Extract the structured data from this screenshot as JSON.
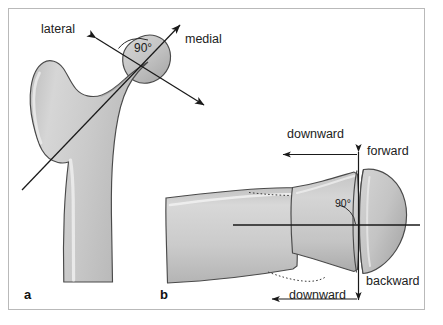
{
  "figure": {
    "background_color": "#ffffff",
    "border_color": "#b9b9b9",
    "bone_fill_color": "#c9c9c9",
    "bone_outline_color": "#4a4a4a",
    "arrow_color": "#1a1a1a",
    "text_color": "#1a1a1a"
  },
  "panel_a": {
    "letter": "a",
    "view": "frontal view of proximal femur",
    "labels": {
      "lateral": "lateral",
      "medial": "medial",
      "angle": "90°"
    }
  },
  "panel_b": {
    "letter": "b",
    "view": "axial view of proximal femur",
    "labels": {
      "downward_top": "downward",
      "downward_bottom": "downward",
      "forward": "forward",
      "backward": "backward",
      "angle": "90°"
    }
  }
}
